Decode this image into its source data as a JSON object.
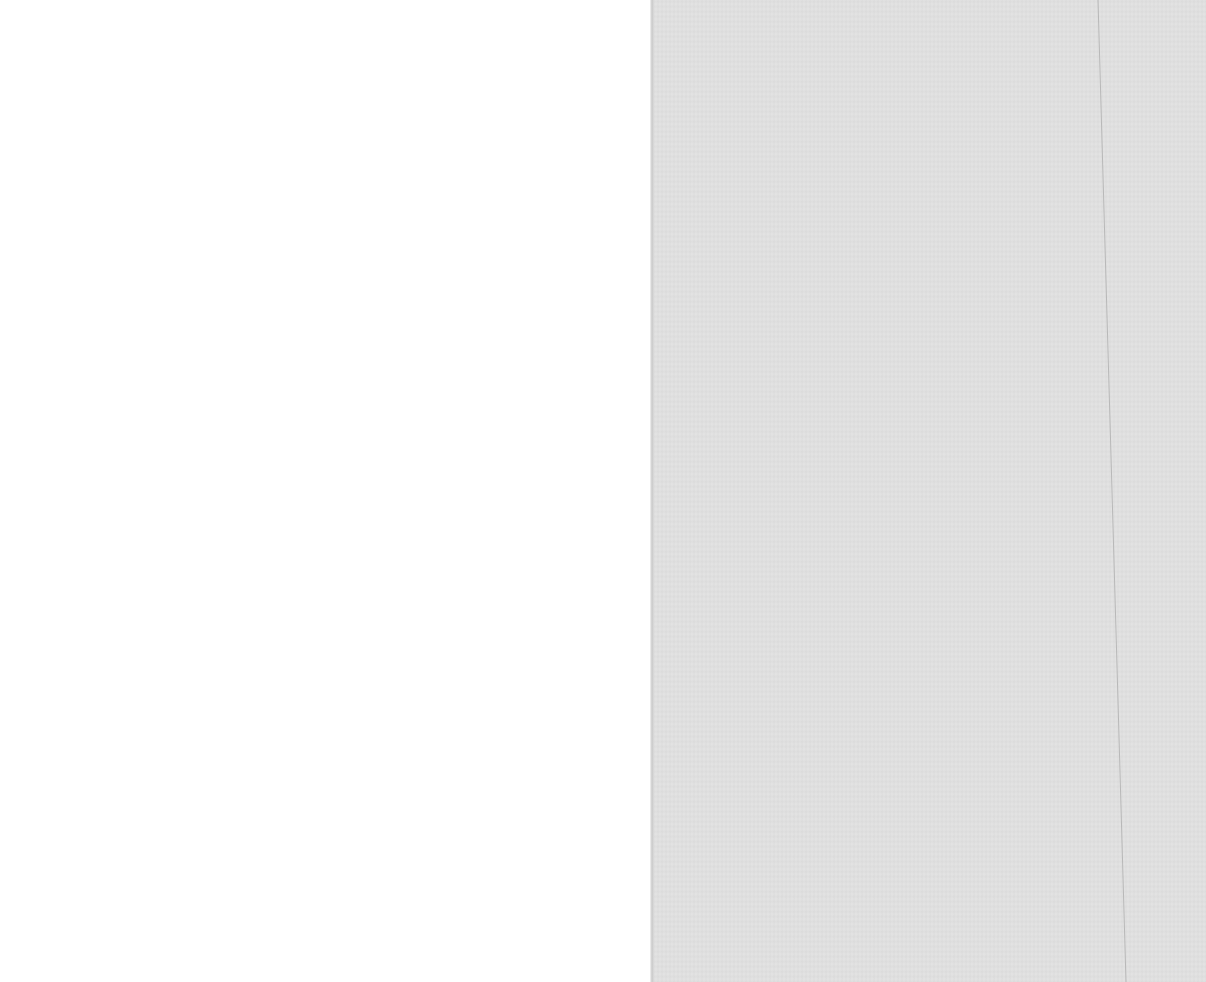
{
  "document": {
    "type": "blank scanned page spread",
    "pages": [
      {
        "side": "left",
        "content": "",
        "color": "#ffffff"
      },
      {
        "side": "right",
        "content": "",
        "color": "#e2e2e2"
      }
    ],
    "crease_color": "#b8b8b8"
  }
}
